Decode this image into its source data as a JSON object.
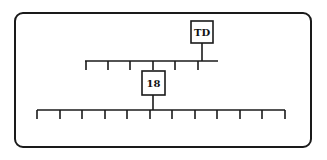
{
  "diagram": {
    "type": "tree",
    "nodes": [
      {
        "id": "td",
        "label": "TD"
      },
      {
        "id": "n18",
        "label": "18"
      }
    ],
    "upper_bar": {
      "ticks": 6,
      "parent": "TD"
    },
    "lower_bar": {
      "ticks": 12,
      "parent": "18"
    }
  }
}
